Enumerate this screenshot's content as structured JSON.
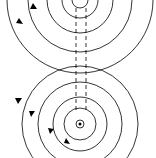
{
  "diagram": {
    "stroke_color": "#000000",
    "background": "#ffffff",
    "wires": [
      {
        "name": "top-wire",
        "cx": 80,
        "cy": 2,
        "radii": [
          10,
          22,
          40,
          58,
          80
        ]
      },
      {
        "name": "bottom-wire",
        "cx": 80,
        "cy": 124,
        "current": "out-of-page",
        "radii": [
          4,
          15,
          26,
          40,
          58,
          80
        ]
      }
    ],
    "dashed_lines_x": [
      76,
      86
    ]
  }
}
